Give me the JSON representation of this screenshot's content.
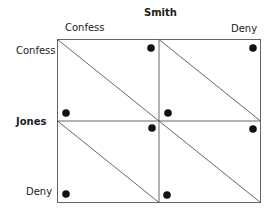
{
  "column_player": {
    "name": "Smith",
    "strategies": [
      "Confess",
      "Deny"
    ]
  },
  "row_player": {
    "name": "Jones",
    "strategies": [
      "Confess",
      "Deny"
    ]
  },
  "colors": {
    "line": "#555555",
    "dot": "#111111",
    "text": "#222222"
  },
  "cells": [
    {
      "row": "Confess",
      "col": "Confess",
      "dots": [
        "top-right",
        "bottom-left"
      ]
    },
    {
      "row": "Confess",
      "col": "Deny",
      "dots": [
        "top-right",
        "bottom-left"
      ]
    },
    {
      "row": "Deny",
      "col": "Confess",
      "dots": [
        "top-right",
        "bottom-left"
      ]
    },
    {
      "row": "Deny",
      "col": "Deny",
      "dots": [
        "top-right",
        "bottom-left"
      ]
    }
  ]
}
